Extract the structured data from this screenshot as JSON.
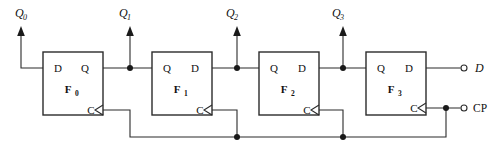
{
  "diagram": {
    "kind": "logic-circuit",
    "width": 493,
    "height": 153,
    "colors": {
      "background": "#ffffff",
      "wire": "#2b2b2b",
      "box_stroke": "#2b2b2b",
      "text": "#111111",
      "node": "#1a1a1a"
    }
  },
  "flipflops": [
    {
      "id": "F0",
      "name": "F",
      "subscript": "0",
      "mirrored": false,
      "left_pin": "D",
      "right_pin": "Q",
      "clock_pin": "C",
      "box": {
        "x": 43,
        "y": 52,
        "w": 60,
        "h": 63
      }
    },
    {
      "id": "F1",
      "name": "F",
      "subscript": "1",
      "mirrored": true,
      "left_pin": "Q",
      "right_pin": "D",
      "clock_pin": "C",
      "box": {
        "x": 152,
        "y": 52,
        "w": 60,
        "h": 63
      }
    },
    {
      "id": "F2",
      "name": "F",
      "subscript": "2",
      "mirrored": true,
      "left_pin": "Q",
      "right_pin": "D",
      "clock_pin": "C",
      "box": {
        "x": 259,
        "y": 52,
        "w": 60,
        "h": 63
      }
    },
    {
      "id": "F3",
      "name": "F",
      "subscript": "3",
      "mirrored": true,
      "left_pin": "Q",
      "right_pin": "D",
      "clock_pin": "C",
      "box": {
        "x": 366,
        "y": 52,
        "w": 60,
        "h": 63
      }
    }
  ],
  "outputs": [
    {
      "id": "Q0",
      "name": "Q",
      "subscript": "0",
      "x": 21,
      "y": 14
    },
    {
      "id": "Q1",
      "name": "Q",
      "subscript": "1",
      "x": 125,
      "y": 14
    },
    {
      "id": "Q2",
      "name": "Q",
      "subscript": "2",
      "x": 231,
      "y": 14
    },
    {
      "id": "Q3",
      "name": "Q",
      "subscript": "3",
      "x": 337,
      "y": 14
    }
  ],
  "terminals": [
    {
      "id": "D-terminal",
      "label": "D",
      "italic": true,
      "pin_x": 464,
      "pin_y": 68,
      "label_x": 475,
      "label_y": 72
    },
    {
      "id": "CP-terminal",
      "label": "CP",
      "italic": false,
      "pin_x": 464,
      "pin_y": 108,
      "label_x": 473,
      "label_y": 112
    }
  ],
  "junctions": [
    {
      "id": "q1-tap",
      "x": 130,
      "y": 68
    },
    {
      "id": "q2-tap",
      "x": 237,
      "y": 68
    },
    {
      "id": "q3-tap",
      "x": 343,
      "y": 68
    },
    {
      "id": "clk-bus-1",
      "x": 237,
      "y": 137
    },
    {
      "id": "clk-bus-2",
      "x": 343,
      "y": 137
    },
    {
      "id": "clk-cp-tap",
      "x": 446,
      "y": 108
    }
  ]
}
